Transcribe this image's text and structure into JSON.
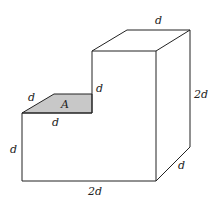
{
  "figure": {
    "labels": {
      "top_depth": "d",
      "right_height": "2d",
      "bottom_depth": "d",
      "bottom_width": "2d",
      "left_height": "d",
      "ledge_depth": "d",
      "ledge_width": "d",
      "step_height": "d",
      "area": "A"
    },
    "colors": {
      "line": "#222222",
      "shade": "#c8c8c8",
      "background": "#ffffff"
    }
  }
}
